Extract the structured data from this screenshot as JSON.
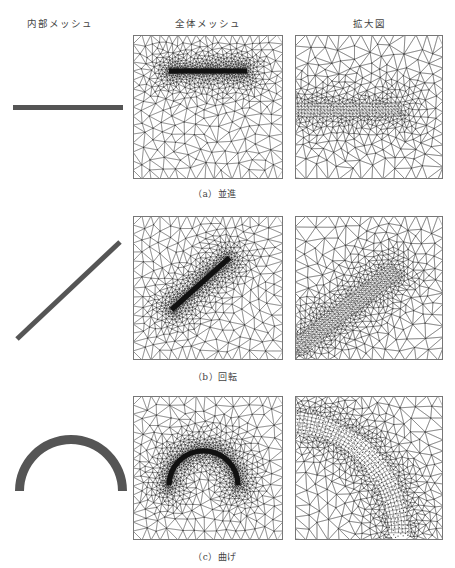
{
  "headers": {
    "inner_mesh": "内部メッシュ",
    "global_mesh": "全体メッシュ",
    "zoom_view": "拡大図"
  },
  "rows": [
    {
      "id": "a",
      "caption": "（a）並進",
      "motion": "translation",
      "inner_shape": {
        "type": "horizontal-bar",
        "x1": 13,
        "x2": 123,
        "y": 107.5,
        "thickness": 5
      },
      "global_panel": {
        "x": 133,
        "y": 35,
        "w": 150,
        "h": 144,
        "element": {
          "type": "bar",
          "cx": 0.5,
          "cy": 0.25,
          "len": 0.52,
          "angle": 0,
          "thickness": 0.035
        }
      },
      "zoom_panel": {
        "x": 295,
        "y": 35,
        "w": 148,
        "h": 144,
        "element": {
          "type": "bar-end",
          "x0": 0.0,
          "x1": 0.72,
          "cy": 0.52,
          "thickness": 0.09,
          "angle": 0
        }
      }
    },
    {
      "id": "b",
      "caption": "（b）回転",
      "motion": "rotation",
      "inner_shape": {
        "type": "diagonal-bar",
        "x1": 17,
        "y1": 339,
        "x2": 120,
        "y2": 242,
        "thickness": 5
      },
      "global_panel": {
        "x": 133,
        "y": 216,
        "w": 150,
        "h": 144,
        "element": {
          "type": "bar",
          "cx": 0.45,
          "cy": 0.47,
          "len": 0.52,
          "angle": -42,
          "thickness": 0.035
        }
      },
      "zoom_panel": {
        "x": 295,
        "y": 216,
        "w": 148,
        "h": 144,
        "element": {
          "type": "bar-end",
          "x0": -0.1,
          "x1": 0.78,
          "cy": 0.65,
          "thickness": 0.12,
          "angle": -38
        }
      }
    },
    {
      "id": "c",
      "caption": "（c）曲げ",
      "motion": "bending",
      "inner_shape": {
        "type": "arch",
        "cx": 71,
        "cy": 491,
        "r_outer": 56,
        "r_inner": 47
      },
      "global_panel": {
        "x": 133,
        "y": 396,
        "w": 150,
        "h": 144,
        "element": {
          "type": "arch",
          "cx": 0.47,
          "cy": 0.62,
          "r": 0.23,
          "thickness": 0.035
        }
      },
      "zoom_panel": {
        "x": 295,
        "y": 396,
        "w": 148,
        "h": 144,
        "element": {
          "type": "arch-zoom",
          "cx": -0.05,
          "cy": 0.95,
          "r": 0.75,
          "thickness": 0.14
        }
      }
    }
  ],
  "colors": {
    "mesh_line": "#5a5a5a",
    "dense_core": "#111111",
    "inner_fill": "#555555",
    "background": "#ffffff",
    "text": "#444444"
  }
}
